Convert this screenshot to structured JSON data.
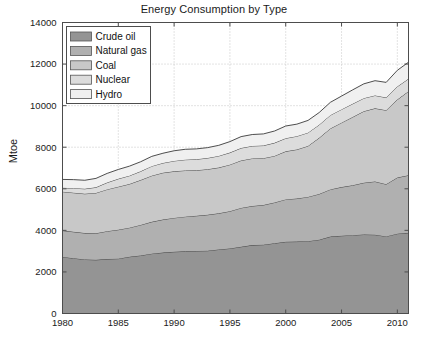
{
  "chart_data": {
    "type": "area",
    "stacked": true,
    "title": "Energy Consumption by Type",
    "xlabel": "",
    "ylabel": "Mtoe",
    "xlim": [
      1980,
      2011
    ],
    "ylim": [
      0,
      14000
    ],
    "xticks": [
      1980,
      1985,
      1990,
      1995,
      2000,
      2005,
      2010
    ],
    "yticks": [
      0,
      2000,
      4000,
      6000,
      8000,
      10000,
      12000,
      14000
    ],
    "grid": "dotted",
    "legend_position": "upper-left",
    "x": [
      1980,
      1981,
      1982,
      1983,
      1984,
      1985,
      1986,
      1987,
      1988,
      1989,
      1990,
      1991,
      1992,
      1993,
      1994,
      1995,
      1996,
      1997,
      1998,
      1999,
      2000,
      2001,
      2002,
      2003,
      2004,
      2005,
      2006,
      2007,
      2008,
      2009,
      2010,
      2011
    ],
    "series": [
      {
        "name": "Crude oil",
        "color": "#949494",
        "values": [
          2720,
          2660,
          2600,
          2580,
          2620,
          2640,
          2730,
          2790,
          2880,
          2930,
          2970,
          2990,
          3010,
          3020,
          3080,
          3130,
          3210,
          3290,
          3310,
          3380,
          3450,
          3460,
          3480,
          3550,
          3700,
          3740,
          3770,
          3800,
          3790,
          3710,
          3840,
          3880
        ]
      },
      {
        "name": "Natural gas",
        "color": "#b0b0b0",
        "values": [
          1270,
          1270,
          1270,
          1280,
          1340,
          1390,
          1400,
          1470,
          1530,
          1590,
          1630,
          1670,
          1690,
          1730,
          1740,
          1790,
          1870,
          1880,
          1910,
          1960,
          2040,
          2070,
          2130,
          2200,
          2270,
          2340,
          2400,
          2490,
          2560,
          2510,
          2700,
          2770
        ]
      },
      {
        "name": "Coal",
        "color": "#c8c8c8",
        "values": [
          1870,
          1880,
          1890,
          1940,
          2010,
          2070,
          2100,
          2160,
          2220,
          2250,
          2240,
          2220,
          2190,
          2190,
          2200,
          2240,
          2280,
          2290,
          2250,
          2240,
          2310,
          2360,
          2450,
          2700,
          2930,
          3100,
          3280,
          3440,
          3520,
          3560,
          3750,
          4040
        ]
      },
      {
        "name": "Nuclear",
        "color": "#dcdcdc",
        "values": [
          190,
          220,
          240,
          270,
          330,
          380,
          400,
          420,
          460,
          470,
          500,
          520,
          530,
          540,
          560,
          580,
          600,
          600,
          610,
          630,
          630,
          640,
          640,
          630,
          640,
          640,
          640,
          630,
          620,
          610,
          630,
          600
        ]
      },
      {
        "name": "Hydro",
        "color": "#f0f0f0",
        "values": [
          400,
          410,
          410,
          430,
          440,
          450,
          460,
          460,
          470,
          470,
          490,
          500,
          500,
          500,
          510,
          530,
          550,
          550,
          560,
          570,
          590,
          580,
          590,
          590,
          620,
          640,
          670,
          690,
          710,
          730,
          780,
          800
        ]
      }
    ],
    "totals_note": "1980 total approx 6450; 2011 total approx 12090"
  },
  "axis": {
    "ytick_labels": [
      "0",
      "2000",
      "4000",
      "6000",
      "8000",
      "10000",
      "12000",
      "14000"
    ],
    "xtick_labels": [
      "1980",
      "1985",
      "1990",
      "1995",
      "2000",
      "2005",
      "2010"
    ]
  },
  "legend": {
    "items": [
      {
        "label": "Crude oil"
      },
      {
        "label": "Natural gas"
      },
      {
        "label": "Coal"
      },
      {
        "label": "Nuclear"
      },
      {
        "label": "Hydro"
      }
    ]
  },
  "colors": {
    "axis": "#4d4d4d",
    "grid": "#b9b9b9",
    "edge": "#3a3a3a",
    "background": "#ffffff"
  }
}
